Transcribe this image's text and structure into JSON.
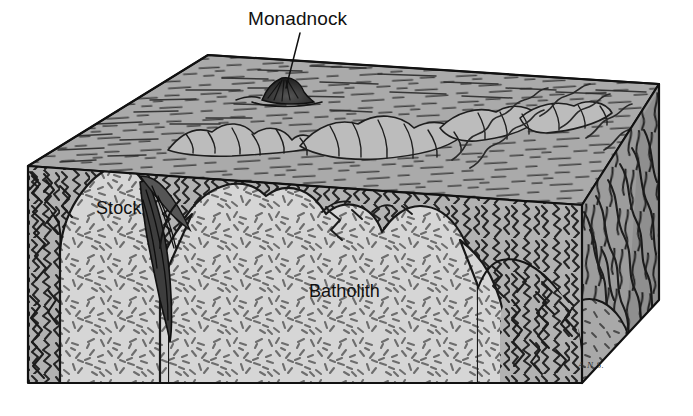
{
  "figure": {
    "kind": "geologic-block-diagram",
    "signature": "A.N.S."
  },
  "labels": {
    "monadnock": "Monadnock",
    "stock": "Stock",
    "batholith": "Batholith"
  },
  "colors": {
    "page_background": "#ffffff",
    "ink": "#1a1a1a",
    "label_text": "#111111",
    "granite_fill": "#d5d5d5",
    "granite_speck": "#6a6a6a",
    "top_surface_fill": "#a9a9a9",
    "top_surface_line": "#2b2b2b",
    "country_rock_front_fill": "#b0b0b0",
    "country_rock_side_fill": "#9a9a9a",
    "country_rock_line": "#262626",
    "hill_highlight": "#c4c4c4",
    "shadow": "#4a4a4a"
  },
  "geometry": {
    "block": {
      "front_top_left": [
        28,
        166
      ],
      "front_top_right": [
        582,
        205
      ],
      "front_bottom_left": [
        28,
        383
      ],
      "front_bottom_right": [
        582,
        383
      ],
      "back_top_left": [
        208,
        55
      ],
      "back_top_right": [
        659,
        84
      ],
      "right_bottom_back": [
        659,
        300
      ]
    },
    "top_surface_note": "erosional plain viewed in oblique projection",
    "right_face_note": "foliated metamorphic country rock",
    "left_face_note": "contorted metamorphic country rock"
  },
  "units": [
    {
      "name": "Batholith",
      "rock": "granitic plutonic rock",
      "pattern": "randomly oriented dash stipple",
      "position": "core of block, large intrusive mass"
    },
    {
      "name": "Stock",
      "rock": "granitic plutonic rock",
      "pattern": "randomly oriented dash stipple",
      "position": "small satellite cupola left of batholith, separated by septum of country rock"
    },
    {
      "name": "Country rock",
      "rock": "contorted / foliated metamorphic rock",
      "pattern": "wavy contorted foliation lines",
      "position": "surrounds and overlies the pluton, forms left, right and rear walls"
    },
    {
      "name": "Monadnock",
      "rock": "erosion-resistant residual hill",
      "pattern": "small dark knob with radiating shading",
      "position": "isolated hill on erosional plain, rear-left of top surface"
    }
  ],
  "annotations": [
    {
      "id": "monadnock-leader",
      "label": "Monadnock",
      "leader_from": [
        300,
        33
      ],
      "leader_to": [
        286,
        86
      ]
    }
  ]
}
